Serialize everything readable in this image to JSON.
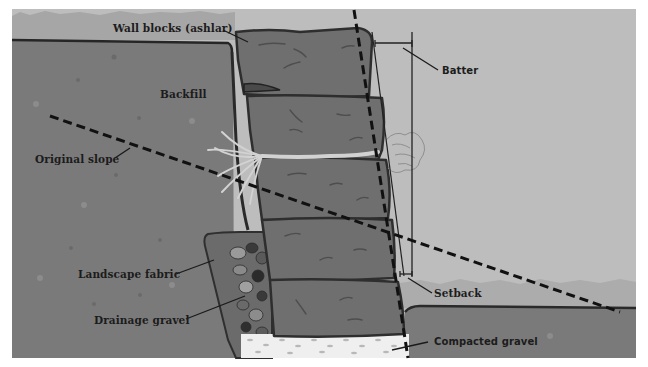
{
  "diagram": {
    "colors": {
      "sky": "#bdbdbd",
      "grass": "#a6a6a6",
      "soil": "#7a7a7a",
      "block": "#6f6f6f",
      "outline": "#333333",
      "gravel_fill": "#efefef",
      "dashed_line": "#111111",
      "root": "#d2d2d2"
    },
    "labels": {
      "wall_blocks": "Wall blocks (ashlar)",
      "backfill": "Backfill",
      "batter": "Batter",
      "original_slope": "Original slope",
      "landscape_fabric": "Landscape fabric",
      "drainage_gravel": "Drainage gravel",
      "setback": "Setback",
      "compacted_gravel": "Compacted gravel"
    }
  }
}
